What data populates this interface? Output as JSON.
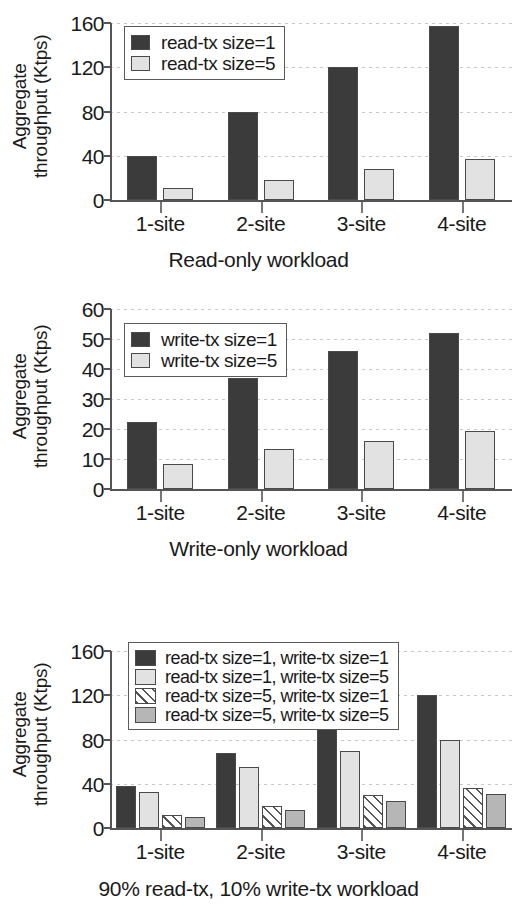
{
  "charts": [
    {
      "id": "read-only",
      "ylabel_line1": "Aggregate",
      "ylabel_line2": "throughput (Ktps)",
      "caption": "Read-only workload",
      "yticks": [
        "0",
        "40",
        "80",
        "120",
        "160"
      ],
      "categories": [
        "1-site",
        "2-site",
        "3-site",
        "4-site"
      ],
      "legend": [
        {
          "label": "read-tx size=1",
          "swatch": "dark"
        },
        {
          "label": "read-tx size=5",
          "swatch": "light"
        }
      ]
    },
    {
      "id": "write-only",
      "ylabel_line1": "Aggregate",
      "ylabel_line2": "throughput (Ktps)",
      "caption": "Write-only workload",
      "yticks": [
        "0",
        "10",
        "20",
        "30",
        "40",
        "50",
        "60"
      ],
      "categories": [
        "1-site",
        "2-site",
        "3-site",
        "4-site"
      ],
      "legend": [
        {
          "label": "write-tx size=1",
          "swatch": "dark"
        },
        {
          "label": "write-tx size=5",
          "swatch": "light"
        }
      ]
    },
    {
      "id": "mixed-90-10",
      "ylabel_line1": "Aggregate",
      "ylabel_line2": "throughput (Ktps)",
      "caption": "90% read-tx, 10% write-tx workload",
      "yticks": [
        "0",
        "40",
        "80",
        "120",
        "160"
      ],
      "categories": [
        "1-site",
        "2-site",
        "3-site",
        "4-site"
      ],
      "legend": [
        {
          "label": "read-tx size=1, write-tx size=1",
          "swatch": "dark"
        },
        {
          "label": "read-tx size=1, write-tx size=5",
          "swatch": "light"
        },
        {
          "label": "read-tx size=5, write-tx size=1",
          "swatch": "hatch"
        },
        {
          "label": "read-tx size=5, write-tx size=5",
          "swatch": "mid"
        }
      ]
    }
  ],
  "colors": {
    "dark": "#3b3b3b",
    "light": "#e2e2e2",
    "mid": "#b6b6b6",
    "hatch": "#ffffff",
    "axis": "#555555",
    "grid": "#c9c9c9"
  },
  "chart_data": [
    {
      "type": "bar",
      "title": "Read-only workload",
      "xlabel": "",
      "ylabel": "Aggregate throughput (Ktps)",
      "ylim": [
        0,
        170
      ],
      "yticks": [
        0,
        40,
        80,
        120,
        160
      ],
      "grid": true,
      "legend_position": "upper-left-inside",
      "categories": [
        "1-site",
        "2-site",
        "3-site",
        "4-site"
      ],
      "series": [
        {
          "name": "read-tx size=1",
          "values": [
            40,
            80,
            120,
            157
          ]
        },
        {
          "name": "read-tx size=5",
          "values": [
            11,
            18,
            28,
            37
          ]
        }
      ]
    },
    {
      "type": "bar",
      "title": "Write-only workload",
      "xlabel": "",
      "ylabel": "Aggregate throughput (Ktps)",
      "ylim": [
        0,
        62
      ],
      "yticks": [
        0,
        10,
        20,
        30,
        40,
        50,
        60
      ],
      "grid": true,
      "legend_position": "upper-left-inside",
      "categories": [
        "1-site",
        "2-site",
        "3-site",
        "4-site"
      ],
      "series": [
        {
          "name": "write-tx size=1",
          "values": [
            22.5,
            37,
            46,
            52
          ]
        },
        {
          "name": "write-tx size=5",
          "values": [
            8.5,
            13.5,
            16,
            19.5
          ]
        }
      ]
    },
    {
      "type": "bar",
      "title": "90% read-tx, 10% write-tx workload",
      "xlabel": "",
      "ylabel": "Aggregate throughput (Ktps)",
      "ylim": [
        0,
        170
      ],
      "yticks": [
        0,
        40,
        80,
        120,
        160
      ],
      "grid": true,
      "legend_position": "upper-center-inside",
      "categories": [
        "1-site",
        "2-site",
        "3-site",
        "4-site"
      ],
      "series": [
        {
          "name": "read-tx size=1, write-tx size=1",
          "values": [
            38,
            68,
            93,
            120
          ]
        },
        {
          "name": "read-tx size=1, write-tx size=5",
          "values": [
            33,
            55,
            70,
            80
          ]
        },
        {
          "name": "read-tx size=5, write-tx size=1",
          "values": [
            12,
            20,
            30,
            36
          ]
        },
        {
          "name": "read-tx size=5, write-tx size=5",
          "values": [
            10,
            16,
            24,
            31
          ]
        }
      ]
    }
  ]
}
